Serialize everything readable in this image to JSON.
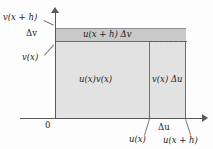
{
  "figure": {
    "type": "geometric-diagram",
    "axes": {
      "origin_label": "0",
      "y_ticks": [
        "v(x + h)",
        "Δv",
        "v(x)"
      ],
      "x_ticks": [
        "u(x)",
        "Δu",
        "u(x + h)"
      ]
    },
    "regions": {
      "top_band": "u(x + h) Δv",
      "main": "u(x)v(x)",
      "side": "v(x) Δu"
    },
    "colors": {
      "band_fill": "#c9c9c9",
      "main_fill": "#e2e2e2",
      "axis": "#5a5a5a",
      "background": "#fdfdfd"
    }
  }
}
